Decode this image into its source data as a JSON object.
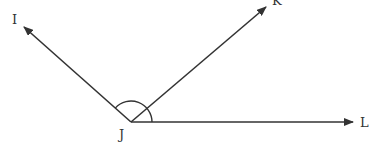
{
  "diagram": {
    "type": "angle-diagram",
    "vertex": {
      "label": "J",
      "x": 131,
      "y": 122
    },
    "rays": [
      {
        "label": "I",
        "tip_x": 24,
        "tip_y": 27,
        "label_x": 12,
        "label_y": 24
      },
      {
        "label": "K",
        "tip_x": 266,
        "tip_y": 7,
        "label_x": 273,
        "label_y": 4
      },
      {
        "label": "L",
        "tip_x": 353,
        "tip_y": 122,
        "label_x": 361,
        "label_y": 127
      }
    ],
    "angle_arc": {
      "from": "I",
      "to": "L",
      "radius": 21
    },
    "stroke_color": "#333333"
  }
}
